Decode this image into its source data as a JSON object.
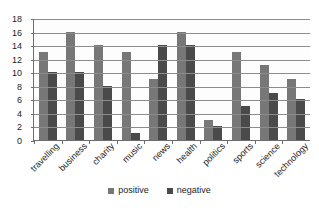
{
  "chart_data": {
    "type": "bar",
    "title": "",
    "subtitle": "",
    "xlabel": "",
    "ylabel": "",
    "ylim": [
      0,
      18
    ],
    "ytick_step": 2,
    "yticks": [
      0,
      2,
      4,
      6,
      8,
      10,
      12,
      14,
      16,
      18
    ],
    "grid": true,
    "legend_position": "bottom",
    "categories": [
      "travelling",
      "business",
      "charity",
      "music",
      "news",
      "health",
      "politics",
      "sports",
      "science",
      "technology"
    ],
    "series": [
      {
        "name": "positive",
        "color": "#777777",
        "values": [
          13,
          16,
          14,
          13,
          9,
          16,
          3,
          13,
          11,
          9
        ]
      },
      {
        "name": "negative",
        "color": "#4a4a4a",
        "values": [
          10,
          10,
          8,
          1,
          14,
          14,
          2,
          5,
          7,
          6
        ]
      }
    ]
  },
  "legend": {
    "items": [
      {
        "label": "positive"
      },
      {
        "label": "negative"
      }
    ]
  }
}
